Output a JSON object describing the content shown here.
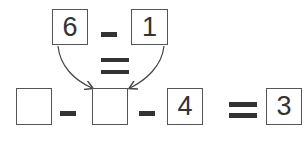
{
  "top_row": {
    "left_value": "6",
    "operator": "minus",
    "right_value": "1"
  },
  "middle": {
    "operator": "equals"
  },
  "bottom_row": {
    "boxes": [
      {
        "value": ""
      },
      {
        "value": ""
      },
      {
        "value": "4"
      }
    ],
    "operators": [
      "minus",
      "minus"
    ],
    "equals_operator": "equals",
    "result": "3"
  },
  "colors": {
    "stroke": "#555555",
    "text": "#333333",
    "operator": "#333333"
  }
}
